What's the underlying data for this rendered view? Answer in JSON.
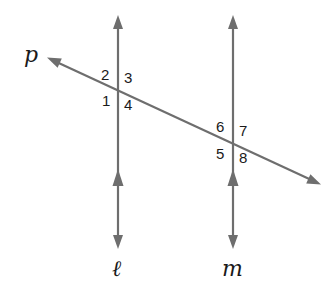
{
  "diagram": {
    "line_color": "#6e6e6e",
    "text_color": "#1a1a1a",
    "lines": {
      "transversal": {
        "label": "p"
      },
      "left_parallel": {
        "label": "ℓ"
      },
      "right_parallel": {
        "label": "m"
      }
    },
    "parallel_relation": "ℓ ∥ m",
    "angles_left_intersection": [
      {
        "id": "angle-1",
        "label": "1",
        "position": "lower-left"
      },
      {
        "id": "angle-2",
        "label": "2",
        "position": "upper-left"
      },
      {
        "id": "angle-3",
        "label": "3",
        "position": "upper-right"
      },
      {
        "id": "angle-4",
        "label": "4",
        "position": "lower-right"
      }
    ],
    "angles_right_intersection": [
      {
        "id": "angle-5",
        "label": "5",
        "position": "lower-left"
      },
      {
        "id": "angle-6",
        "label": "6",
        "position": "upper-left"
      },
      {
        "id": "angle-7",
        "label": "7",
        "position": "upper-right"
      },
      {
        "id": "angle-8",
        "label": "8",
        "position": "lower-right"
      }
    ]
  }
}
